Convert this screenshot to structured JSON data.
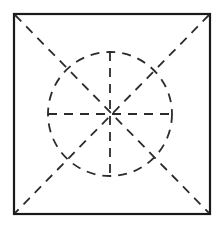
{
  "figure": {
    "canvas": {
      "width": 218,
      "height": 227,
      "background": "#ffffff"
    },
    "colors": {
      "outline": "#1a1a1a",
      "dashed": "#2b2b2b",
      "background": "#ffffff"
    },
    "square": {
      "label": "outer square",
      "x": 14,
      "y": 14,
      "width": 196,
      "height": 200,
      "stroke_width": 2.2,
      "style": "solid"
    },
    "circle": {
      "label": "inscribed dashed circle",
      "cx": 110,
      "cy": 114,
      "r": 62,
      "stroke_width": 1.8,
      "style": "dashed",
      "dash_pattern": "9 7"
    },
    "diagonals": [
      {
        "label": "diagonal top-left to bottom-right",
        "x1": 15,
        "y1": 15,
        "x2": 209,
        "y2": 213
      },
      {
        "label": "diagonal top-right to bottom-left",
        "x1": 209,
        "y1": 15,
        "x2": 15,
        "y2": 213
      }
    ],
    "spokes": [
      {
        "label": "vertical spoke",
        "x1": 110,
        "y1": 52,
        "x2": 110,
        "y2": 176
      },
      {
        "label": "horizontal spoke",
        "x1": 48,
        "y1": 114,
        "x2": 172,
        "y2": 114
      }
    ],
    "spoke_style": {
      "stroke_width": 1.8,
      "style": "dashed",
      "dash_pattern": "9 7"
    },
    "diagonal_style": {
      "stroke_width": 1.8,
      "style": "dashed",
      "dash_pattern": "9 7"
    },
    "notes": {
      "spoke_count": 8,
      "sector_count": 8,
      "description": "Eight equal sectors formed by vertical, horizontal and two corner diagonals crossing at the circle center."
    }
  }
}
